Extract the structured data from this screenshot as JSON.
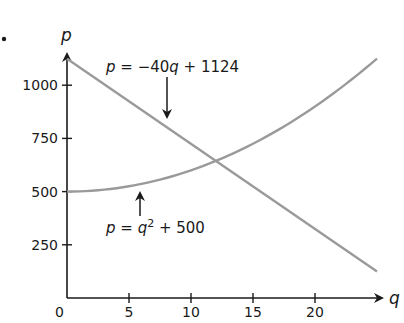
{
  "problem_marker": "•",
  "chart_data": {
    "type": "line",
    "title": "",
    "xlabel": "q",
    "ylabel": "p",
    "xlim": [
      0,
      25
    ],
    "ylim": [
      0,
      1150
    ],
    "x_ticks": [
      0,
      5,
      10,
      15,
      20
    ],
    "y_ticks": [
      250,
      500,
      750,
      1000
    ],
    "x_tick_labels": [
      "0",
      "5",
      "10",
      "15",
      "20"
    ],
    "y_tick_labels": [
      "250",
      "500",
      "750",
      "1000"
    ],
    "grid": false,
    "legend": null,
    "series": [
      {
        "name": "p = −40q + 1124",
        "equation": "p = -40q + 1124",
        "x": [
          0,
          5,
          10,
          15,
          20,
          25
        ],
        "values": [
          1124,
          924,
          724,
          524,
          324,
          124
        ],
        "color": "#9a9a9a"
      },
      {
        "name": "p = q² + 500",
        "equation": "p = q^2 + 500",
        "x": [
          0,
          5,
          10,
          15,
          20,
          25
        ],
        "values": [
          500,
          525,
          600,
          725,
          900,
          1125
        ],
        "color": "#9a9a9a"
      }
    ],
    "annotations": [
      {
        "text": "p = −40q + 1124",
        "arrow_to_series": 0,
        "arrow_direction": "down"
      },
      {
        "text": "p = q² + 500",
        "arrow_to_series": 1,
        "arrow_direction": "up"
      }
    ],
    "intersection": {
      "q": 12,
      "p": 644
    }
  },
  "labels": {
    "origin": "0",
    "q_axis": "q",
    "p_axis": "p",
    "line_eq": {
      "p": "p",
      "eq": " = −40",
      "q": "q",
      "rest": " + 1124"
    },
    "parab_eq": {
      "p": "p",
      "eq": " = ",
      "q": "q",
      "sup": "2",
      "rest": " + 500"
    }
  },
  "colors": {
    "axis": "#1a1a1a",
    "curve": "#9a9a9a"
  }
}
